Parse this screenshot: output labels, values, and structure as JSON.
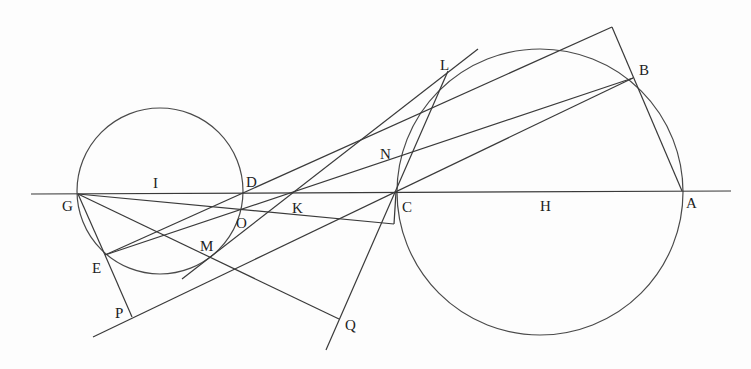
{
  "diagram": {
    "type": "geometric-construction",
    "circles": [
      {
        "name": "small-circle",
        "center_label": "I",
        "cx": 160,
        "cy": 191,
        "r": 83
      },
      {
        "name": "large-circle",
        "center_label": "H",
        "cx": 540,
        "cy": 192,
        "r": 143
      }
    ],
    "points": {
      "G": [
        78,
        194
      ],
      "I": [
        160,
        193
      ],
      "D": [
        243,
        193
      ],
      "K": [
        290,
        193
      ],
      "C": [
        396,
        192
      ],
      "H": [
        540,
        192
      ],
      "A": [
        682,
        191
      ],
      "E": [
        105,
        255
      ],
      "P": [
        132,
        317
      ],
      "M": [
        210,
        257
      ],
      "O": [
        241,
        210
      ],
      "N": [
        397,
        157
      ],
      "L": [
        448,
        71
      ],
      "B": [
        633,
        78
      ],
      "Q": [
        339,
        319
      ],
      "apex": [
        612,
        27
      ],
      "foot": [
        394,
        224
      ]
    },
    "labels": [
      {
        "text": "G",
        "x": 62,
        "y": 211
      },
      {
        "text": "I",
        "x": 153,
        "y": 188
      },
      {
        "text": "D",
        "x": 246,
        "y": 187
      },
      {
        "text": "K",
        "x": 292,
        "y": 213
      },
      {
        "text": "C",
        "x": 402,
        "y": 212
      },
      {
        "text": "H",
        "x": 540,
        "y": 211
      },
      {
        "text": "A",
        "x": 686,
        "y": 208
      },
      {
        "text": "E",
        "x": 92,
        "y": 273
      },
      {
        "text": "P",
        "x": 115,
        "y": 318
      },
      {
        "text": "M",
        "x": 200,
        "y": 251
      },
      {
        "text": "O",
        "x": 236,
        "y": 228
      },
      {
        "text": "N",
        "x": 380,
        "y": 159
      },
      {
        "text": "L",
        "x": 440,
        "y": 70
      },
      {
        "text": "B",
        "x": 639,
        "y": 75
      },
      {
        "text": "Q",
        "x": 345,
        "y": 330
      }
    ],
    "segments": [
      {
        "name": "line-GA",
        "x1": 31,
        "y1": 194,
        "x2": 731,
        "y2": 191
      },
      {
        "name": "line-GE",
        "x1": 78,
        "y1": 194,
        "x2": 105,
        "y2": 255
      },
      {
        "name": "line-EP",
        "x1": 105,
        "y1": 255,
        "x2": 132,
        "y2": 317
      },
      {
        "name": "line-P-C-B",
        "x1": 93,
        "y1": 337,
        "x2": 633,
        "y2": 78
      },
      {
        "name": "line-E-K-N-B",
        "x1": 105,
        "y1": 255,
        "x2": 633,
        "y2": 78
      },
      {
        "name": "line-E-D-apex",
        "x1": 105,
        "y1": 255,
        "x2": 612,
        "y2": 27
      },
      {
        "name": "line-apex-B-A",
        "x1": 612,
        "y1": 27,
        "x2": 682,
        "y2": 191
      },
      {
        "name": "line-GQ",
        "x1": 78,
        "y1": 194,
        "x2": 339,
        "y2": 319
      },
      {
        "name": "line-Q-C-L",
        "x1": 326,
        "y1": 350,
        "x2": 448,
        "y2": 71
      },
      {
        "name": "tangent-M-K-L",
        "x1": 182,
        "y1": 279,
        "x2": 478,
        "y2": 49
      },
      {
        "name": "line-G-O-foot",
        "x1": 78,
        "y1": 194,
        "x2": 394,
        "y2": 224
      },
      {
        "name": "line-C-foot",
        "x1": 396,
        "y1": 192,
        "x2": 394,
        "y2": 224
      }
    ]
  }
}
